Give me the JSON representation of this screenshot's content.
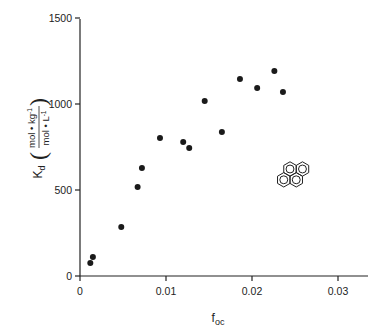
{
  "chart_data": {
    "type": "scatter",
    "title": "",
    "xlabel": "f_oc",
    "ylabel": "K_d (mol·kg⁻¹ / mol·L⁻¹)",
    "xlim": [
      0,
      0.033
    ],
    "ylim": [
      0,
      1500
    ],
    "x_ticks": [
      0,
      0.01,
      0.02,
      0.03
    ],
    "x_tick_labels": [
      "0",
      "0.01",
      "0.02",
      "0.03"
    ],
    "y_ticks": [
      0,
      500,
      1000,
      1500
    ],
    "y_tick_labels": [
      "0",
      "500",
      "1000",
      "1500"
    ],
    "grid": false,
    "legend": null,
    "annotation": "pyrene structure icon (four fused benzene rings)",
    "series": [
      {
        "name": "Kd vs foc",
        "x": [
          0.0012,
          0.0015,
          0.0048,
          0.0067,
          0.0072,
          0.0093,
          0.012,
          0.0127,
          0.0145,
          0.0165,
          0.0186,
          0.0206,
          0.0226,
          0.0236
        ],
        "y": [
          76,
          110,
          285,
          517,
          628,
          802,
          779,
          744,
          1017,
          837,
          1145,
          1093,
          1192,
          1070
        ]
      }
    ]
  },
  "labels": {
    "xlabel_main": "f",
    "xlabel_sub": "oc",
    "ylabel_main": "K",
    "ylabel_sub": "d",
    "ylabel_num": "mol • kg",
    "ylabel_num_sup": "-1",
    "ylabel_den": "mol • L",
    "ylabel_den_sup": "-1"
  },
  "colors": {
    "ink": "#222222",
    "background": "#ffffff"
  }
}
